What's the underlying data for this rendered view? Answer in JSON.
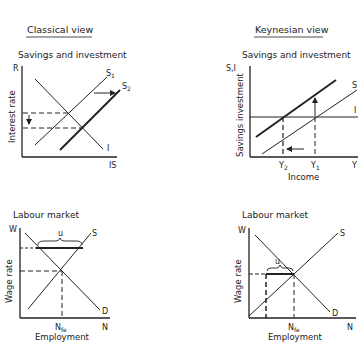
{
  "panels": {
    "classical": {
      "heading": "Classical view",
      "savings_investment": {
        "title": "Savings and investment",
        "y_axis_symbol": "R",
        "y_axis_label": "Interest rate",
        "x_axis_symbol": "IS",
        "curve_investment": "I",
        "curve_savings_1": "S",
        "curve_savings_1_sub": "1",
        "curve_savings_2": "S",
        "curve_savings_2_sub": "2"
      },
      "labour_market": {
        "title": "Labour market",
        "y_axis_symbol": "W",
        "y_axis_label": "Wage rate",
        "x_axis_symbol": "N",
        "x_axis_label": "Employment",
        "curve_supply": "S",
        "curve_demand": "D",
        "unemployment": "u",
        "full_employment": "N",
        "full_employment_sub": "fe"
      }
    },
    "keynesian": {
      "heading": "Keynesian view",
      "savings_investment": {
        "title": "Savings and investment",
        "y_axis_symbol": "S,I",
        "y_axis_label": "Savings investment",
        "x_axis_symbol": "Y",
        "x_axis_label": "Income",
        "curve_investment": "I",
        "curve_savings": "S",
        "income_2": "Y",
        "income_2_sub": "2",
        "income_1": "Y",
        "income_1_sub": "1"
      },
      "labour_market": {
        "title": "Labour market",
        "y_axis_symbol": "W",
        "y_axis_label": "Wage rate",
        "x_axis_symbol": "N",
        "x_axis_label": "Employment",
        "curve_supply": "S",
        "curve_demand": "D",
        "unemployment": "u",
        "full_employment": "N",
        "full_employment_sub": "fe"
      }
    }
  },
  "colors": {
    "ink": "#222222",
    "background": "#ffffff"
  }
}
